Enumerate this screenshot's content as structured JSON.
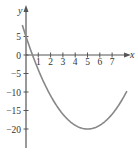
{
  "chart_data": {
    "type": "line",
    "title": "",
    "xlabel": "x",
    "ylabel": "y",
    "function": "y = x^2 - 10x + 5",
    "xlim": [
      0,
      8.5
    ],
    "ylim": [
      -25,
      8
    ],
    "grid": false,
    "x_ticks": [
      1,
      2,
      3,
      4,
      5,
      6,
      7
    ],
    "y_ticks": [
      5,
      0,
      -5,
      -10,
      -15,
      -20
    ],
    "x_tick_labels": [
      "1",
      "2",
      "3",
      "4",
      "5",
      "6",
      "7"
    ],
    "y_tick_labels": [
      "5",
      "0",
      "−5",
      "−10",
      "−15",
      "−20"
    ],
    "series": [
      {
        "name": "parabola",
        "color": "#888888",
        "x": [
          -0.3,
          0,
          0.5,
          1,
          2,
          3,
          4,
          5,
          6,
          7,
          8,
          8.2
        ],
        "y": [
          8.09,
          5,
          0.25,
          -4,
          -11,
          -16,
          -19,
          -20,
          -19,
          -16,
          -11,
          -9.76
        ]
      }
    ],
    "vertex": {
      "x": 5,
      "y": -20
    }
  }
}
